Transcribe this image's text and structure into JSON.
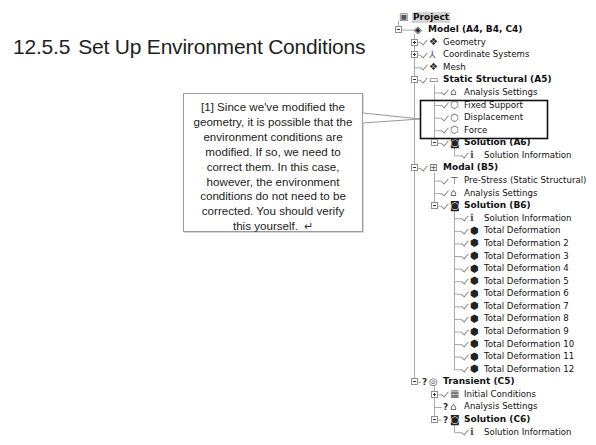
{
  "heading": {
    "number": "12.5.5",
    "title": "Set Up Environment Conditions"
  },
  "callout": {
    "lines": [
      "[1] Since we've modified the",
      "geometry, it is possible that the",
      "environment conditions are",
      "modified.  If so, we need to",
      "correct them.  In this case,",
      "however, the environment",
      "conditions do not need to be",
      "corrected. You should verify",
      "this yourself."
    ],
    "return_symbol": "↵"
  },
  "tree": {
    "colors": {
      "line": "#a0a0a0",
      "highlight_box": "#111111",
      "selected_bg": "#d4d4d4"
    },
    "rows": [
      {
        "label": "Project",
        "level": 0,
        "icon": "project-icon",
        "bold": true,
        "selected": true,
        "expander": null,
        "status": null
      },
      {
        "label": "Model (A4, B4, C4)",
        "level": 1,
        "icon": "model-icon",
        "bold": true,
        "expander": "minus",
        "status": null
      },
      {
        "label": "Geometry",
        "level": 2,
        "icon": "geometry-icon",
        "bold": false,
        "expander": "plus",
        "status": "check"
      },
      {
        "label": "Coordinate Systems",
        "level": 2,
        "icon": "coordinate-systems-icon",
        "bold": false,
        "expander": "plus",
        "status": "check"
      },
      {
        "label": "Mesh",
        "level": 2,
        "icon": "mesh-icon",
        "bold": false,
        "expander": null,
        "status": "check"
      },
      {
        "label": "Static Structural (A5)",
        "level": 2,
        "icon": "static-structural-icon",
        "bold": true,
        "expander": "minus",
        "status": "check"
      },
      {
        "label": "Analysis Settings",
        "level": 3,
        "icon": "analysis-settings-icon",
        "bold": false,
        "expander": null,
        "status": "check"
      },
      {
        "label": "Fixed Support",
        "level": 3,
        "icon": "fixed-support-icon",
        "bold": false,
        "expander": null,
        "status": "check"
      },
      {
        "label": "Displacement",
        "level": 3,
        "icon": "displacement-icon",
        "bold": false,
        "expander": null,
        "status": "check"
      },
      {
        "label": "Force",
        "level": 3,
        "icon": "force-icon",
        "bold": false,
        "expander": null,
        "status": "check"
      },
      {
        "label": "Solution (A6)",
        "level": 3,
        "icon": "solution-icon",
        "bold": true,
        "expander": "minus",
        "status": "check"
      },
      {
        "label": "Solution Information",
        "level": 4,
        "icon": "solution-information-icon",
        "bold": false,
        "expander": null,
        "status": "check"
      },
      {
        "label": "Modal (B5)",
        "level": 2,
        "icon": "modal-icon",
        "bold": true,
        "expander": "minus",
        "status": "check"
      },
      {
        "label": "Pre-Stress (Static Structural)",
        "level": 3,
        "icon": "pre-stress-icon",
        "bold": false,
        "expander": null,
        "status": "check"
      },
      {
        "label": "Analysis Settings",
        "level": 3,
        "icon": "analysis-settings-icon",
        "bold": false,
        "expander": null,
        "status": "check"
      },
      {
        "label": "Solution (B6)",
        "level": 3,
        "icon": "solution-icon",
        "bold": true,
        "expander": "minus",
        "status": "check"
      },
      {
        "label": "Solution Information",
        "level": 4,
        "icon": "solution-information-icon",
        "bold": false,
        "expander": null,
        "status": "check"
      },
      {
        "label": "Total Deformation",
        "level": 4,
        "icon": "total-deformation-icon",
        "bold": false,
        "expander": null,
        "status": "check"
      },
      {
        "label": "Total Deformation 2",
        "level": 4,
        "icon": "total-deformation-icon",
        "bold": false,
        "expander": null,
        "status": "check"
      },
      {
        "label": "Total Deformation 3",
        "level": 4,
        "icon": "total-deformation-icon",
        "bold": false,
        "expander": null,
        "status": "check"
      },
      {
        "label": "Total Deformation 4",
        "level": 4,
        "icon": "total-deformation-icon",
        "bold": false,
        "expander": null,
        "status": "check"
      },
      {
        "label": "Total Deformation 5",
        "level": 4,
        "icon": "total-deformation-icon",
        "bold": false,
        "expander": null,
        "status": "check"
      },
      {
        "label": "Total Deformation 6",
        "level": 4,
        "icon": "total-deformation-icon",
        "bold": false,
        "expander": null,
        "status": "check"
      },
      {
        "label": "Total Deformation 7",
        "level": 4,
        "icon": "total-deformation-icon",
        "bold": false,
        "expander": null,
        "status": "check"
      },
      {
        "label": "Total Deformation 8",
        "level": 4,
        "icon": "total-deformation-icon",
        "bold": false,
        "expander": null,
        "status": "check"
      },
      {
        "label": "Total Deformation 9",
        "level": 4,
        "icon": "total-deformation-icon",
        "bold": false,
        "expander": null,
        "status": "check"
      },
      {
        "label": "Total Deformation 10",
        "level": 4,
        "icon": "total-deformation-icon",
        "bold": false,
        "expander": null,
        "status": "check"
      },
      {
        "label": "Total Deformation 11",
        "level": 4,
        "icon": "total-deformation-icon",
        "bold": false,
        "expander": null,
        "status": "check"
      },
      {
        "label": "Total Deformation 12",
        "level": 4,
        "icon": "total-deformation-icon",
        "bold": false,
        "expander": null,
        "status": "check"
      },
      {
        "label": "Transient (C5)",
        "level": 2,
        "icon": "transient-icon",
        "bold": true,
        "expander": "minus",
        "status": "question"
      },
      {
        "label": "Initial Conditions",
        "level": 3,
        "icon": "initial-conditions-icon",
        "bold": false,
        "expander": "plus",
        "status": "check"
      },
      {
        "label": "Analysis Settings",
        "level": 3,
        "icon": "analysis-settings-icon",
        "bold": false,
        "expander": null,
        "status": "question"
      },
      {
        "label": "Solution (C6)",
        "level": 3,
        "icon": "solution-icon",
        "bold": true,
        "expander": "minus",
        "status": "question"
      },
      {
        "label": "Solution Information",
        "level": 4,
        "icon": "solution-information-icon",
        "bold": false,
        "expander": null,
        "status": "check"
      }
    ]
  }
}
